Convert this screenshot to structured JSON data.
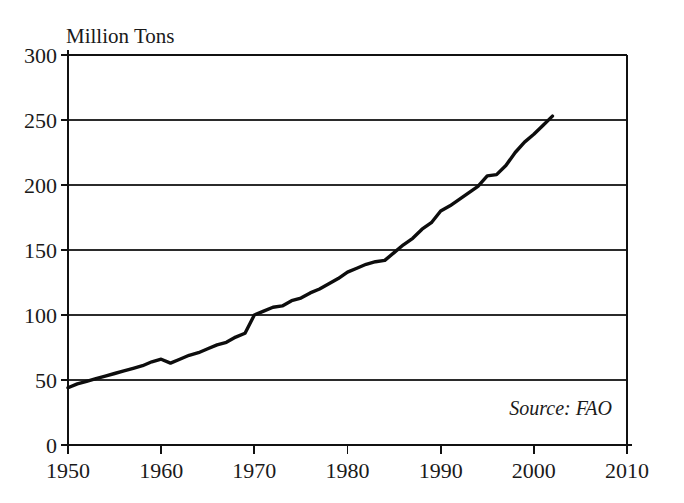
{
  "chart_data": {
    "type": "line",
    "title": "",
    "ylabel": "Million Tons",
    "xlabel": "",
    "source_note": "Source: FAO",
    "xlim": [
      1950,
      2010
    ],
    "ylim": [
      0,
      300
    ],
    "grid": true,
    "legend": "none",
    "y_ticks": [
      0,
      50,
      100,
      150,
      200,
      250,
      300
    ],
    "y_tick_labels": [
      "0",
      "50",
      "100",
      "150",
      "200",
      "250",
      "300"
    ],
    "x_ticks": [
      1950,
      1960,
      1970,
      1980,
      1990,
      2000,
      2010
    ],
    "x_tick_labels": [
      "1950",
      "1960",
      "1970",
      "1980",
      "1990",
      "2000",
      "2010"
    ],
    "series": [
      {
        "name": "Million Tons",
        "color": "#0d0d0d",
        "x": [
          1950,
          1951,
          1952,
          1953,
          1954,
          1955,
          1956,
          1957,
          1958,
          1959,
          1960,
          1961,
          1962,
          1963,
          1964,
          1965,
          1966,
          1967,
          1968,
          1969,
          1970,
          1971,
          1972,
          1973,
          1974,
          1975,
          1976,
          1977,
          1978,
          1979,
          1980,
          1981,
          1982,
          1983,
          1984,
          1985,
          1986,
          1987,
          1988,
          1989,
          1990,
          1991,
          1992,
          1993,
          1994,
          1995,
          1996,
          1997,
          1998,
          1999,
          2000,
          2001,
          2002
        ],
        "values": [
          44,
          47,
          49,
          51,
          53,
          55,
          57,
          59,
          61,
          64,
          66,
          63,
          66,
          69,
          71,
          74,
          77,
          79,
          83,
          86,
          100,
          103,
          106,
          107,
          111,
          113,
          117,
          120,
          124,
          128,
          133,
          136,
          139,
          141,
          142,
          148,
          154,
          159,
          166,
          171,
          180,
          184,
          189,
          194,
          199,
          207,
          208,
          215,
          225,
          233,
          239,
          246,
          253
        ]
      }
    ]
  },
  "labels": {
    "y_axis_title": "Million Tons",
    "source": "Source: FAO"
  }
}
